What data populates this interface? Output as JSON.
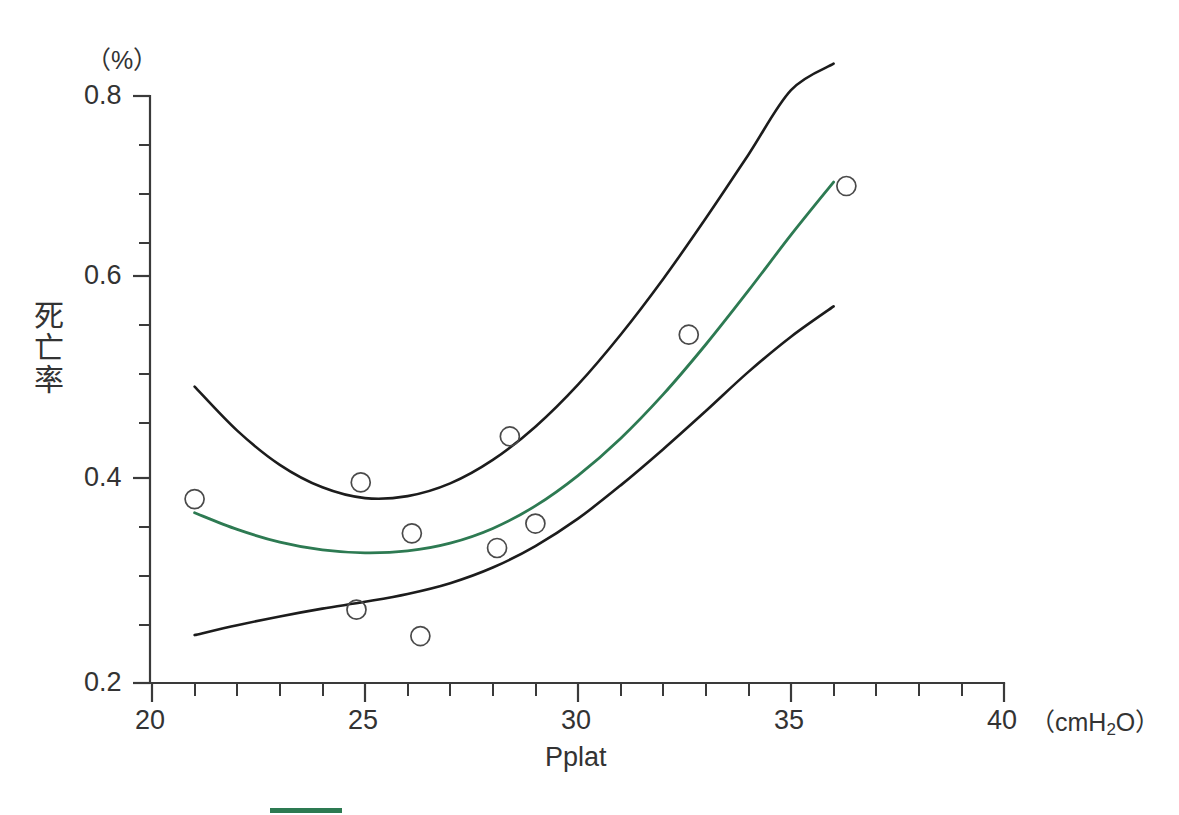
{
  "chart_data": {
    "type": "scatter",
    "title": "",
    "xlabel": "Pplat",
    "ylabel": "死亡率",
    "y_unit": "（%）",
    "x_unit": "（cmH2O）",
    "x_unit_pre": "（cmH",
    "x_unit_sub": "2",
    "x_unit_post": "O）",
    "xlim": [
      20,
      40
    ],
    "ylim": [
      0.2,
      0.8
    ],
    "x_ticks_major": [
      20,
      25,
      30,
      35,
      40
    ],
    "x_tick_labels": [
      "20",
      "25",
      "30",
      "35",
      "40"
    ],
    "x_minor_step": 1,
    "y_ticks_major": [
      0.2,
      0.4,
      0.6,
      0.8
    ],
    "y_tick_labels": [
      "0.2",
      "0.4",
      "0.6",
      "0.8"
    ],
    "y_minor_step": 0.05,
    "grid": false,
    "legend_position": "bottom-left",
    "colors": {
      "fit_line": "#2d7a52",
      "confidence_band": "#1c1c1c",
      "marker_stroke": "#4a4a4a",
      "axis": "#3a3a3a",
      "background": "#ffffff"
    },
    "points": {
      "name": "Observed mortality",
      "marker": "open-circle",
      "x": [
        21.0,
        24.8,
        24.9,
        26.1,
        26.3,
        28.1,
        28.4,
        29.0,
        32.6,
        36.3
      ],
      "y": [
        0.388,
        0.275,
        0.405,
        0.353,
        0.248,
        0.338,
        0.452,
        0.363,
        0.556,
        0.708
      ]
    },
    "series": [
      {
        "name": "Fitted mortality",
        "style": "solid-green",
        "color": "#2d7a52",
        "x": [
          21.0,
          22.0,
          23.0,
          24.0,
          25.0,
          26.0,
          27.0,
          28.0,
          29.0,
          30.0,
          31.0,
          32.0,
          33.0,
          34.0,
          35.0,
          36.0
        ],
        "y": [
          0.374,
          0.357,
          0.344,
          0.336,
          0.333,
          0.335,
          0.343,
          0.358,
          0.381,
          0.412,
          0.45,
          0.495,
          0.546,
          0.601,
          0.658,
          0.712
        ]
      },
      {
        "name": "Upper confidence limit",
        "style": "solid-black",
        "color": "#1c1c1c",
        "x": [
          21.0,
          22.0,
          23.0,
          24.0,
          25.0,
          26.0,
          27.0,
          28.0,
          29.0,
          30.0,
          31.0,
          32.0,
          33.0,
          34.0,
          35.0,
          36.0
        ],
        "y": [
          0.503,
          0.458,
          0.423,
          0.4,
          0.389,
          0.391,
          0.404,
          0.428,
          0.462,
          0.505,
          0.556,
          0.613,
          0.675,
          0.74,
          0.806,
          0.833
        ]
      },
      {
        "name": "Lower confidence limit",
        "style": "solid-black",
        "color": "#1c1c1c",
        "x": [
          21.0,
          22.0,
          23.0,
          24.0,
          25.0,
          26.0,
          27.0,
          28.0,
          29.0,
          30.0,
          31.0,
          32.0,
          33.0,
          34.0,
          35.0,
          36.0
        ],
        "y": [
          0.249,
          0.259,
          0.268,
          0.276,
          0.283,
          0.291,
          0.302,
          0.318,
          0.34,
          0.368,
          0.402,
          0.439,
          0.478,
          0.518,
          0.554,
          0.585
        ]
      }
    ]
  },
  "legend": {
    "swatch_color": "#2d7a52",
    "swatch_label": ""
  }
}
